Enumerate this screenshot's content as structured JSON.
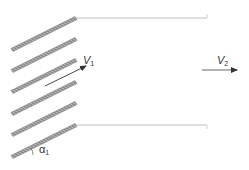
{
  "diagram": {
    "colors": {
      "blade_fill": "#8a8a8a",
      "blade_hatch": "#ffffff",
      "wall": "#bdbdbd",
      "arrow": "#333333",
      "text": "#333333"
    },
    "blades": [
      {
        "x1": 12,
        "y1": 50,
        "x2": 76,
        "y2": 18
      },
      {
        "x1": 12,
        "y1": 71,
        "x2": 76,
        "y2": 39
      },
      {
        "x1": 12,
        "y1": 92,
        "x2": 76,
        "y2": 60
      },
      {
        "x1": 12,
        "y1": 114,
        "x2": 76,
        "y2": 82
      },
      {
        "x1": 12,
        "y1": 135,
        "x2": 76,
        "y2": 103
      },
      {
        "x1": 12,
        "y1": 157,
        "x2": 76,
        "y2": 125
      }
    ],
    "walls": [
      {
        "x1": 77,
        "y1": 18,
        "x2": 207,
        "y2": 18
      },
      {
        "x1": 77,
        "y1": 125,
        "x2": 207,
        "y2": 125
      }
    ],
    "inlet_velocity": {
      "symbol": "V",
      "subscript": "1",
      "arrow": {
        "x1": 45,
        "y1": 86,
        "x2": 86,
        "y2": 66
      }
    },
    "outlet_velocity": {
      "symbol": "V",
      "subscript": "2",
      "arrow": {
        "x1": 202,
        "y1": 70,
        "x2": 237,
        "y2": 70
      }
    },
    "angle": {
      "symbol": "α",
      "subscript": "1"
    }
  }
}
